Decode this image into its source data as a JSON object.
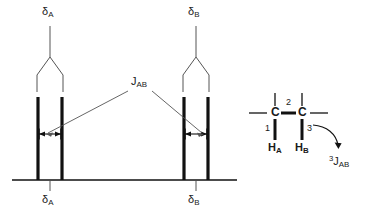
{
  "figure": {
    "ink_color": "#1a1a1a",
    "line_color": "#555555"
  },
  "spectrum": {
    "axis": {
      "name": "chemical-shift-axis",
      "x_start": 12,
      "x_end": 237,
      "y": 180
    },
    "multiplets": [
      {
        "id": "multiplet-a",
        "top_label": "δ",
        "top_label_sub": "A",
        "axis_label": "δ",
        "axis_label_sub": "A",
        "center_x": 50,
        "peak_x": [
          38,
          62
        ],
        "peak_top_y": 97,
        "peak_bottom_y": 180,
        "arrow_y": 134,
        "tree_apex_y": 57,
        "tree_branch_y": 75,
        "stem_top_y": 26
      },
      {
        "id": "multiplet-b",
        "top_label": "δ",
        "top_label_sub": "B",
        "axis_label": "δ",
        "axis_label_sub": "B",
        "center_x": 196,
        "peak_x": [
          184,
          208
        ],
        "peak_top_y": 97,
        "peak_bottom_y": 180,
        "arrow_y": 134,
        "tree_apex_y": 57,
        "tree_branch_y": 75,
        "stem_top_y": 26
      }
    ],
    "coupling_label": {
      "text": "J",
      "sub": "AB",
      "x": 131,
      "y": 82
    }
  },
  "molecule": {
    "carbon_left": "C",
    "carbon_right": "C",
    "bond_labels": {
      "one": "1",
      "two": "2",
      "three": "3"
    },
    "hydrogen_a": "H",
    "hydrogen_a_sub": "A",
    "hydrogen_b": "H",
    "hydrogen_b_sub": "B",
    "coupling_annotation": {
      "sup": "3",
      "text": "J",
      "sub": "AB"
    }
  }
}
